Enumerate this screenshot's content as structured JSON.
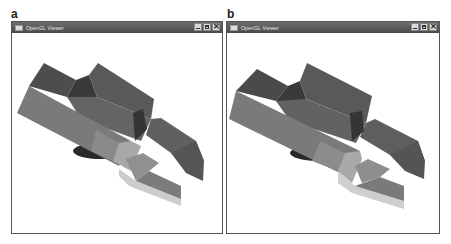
{
  "figure": {
    "panels": [
      {
        "label": "a",
        "window": {
          "title": "OpenGL Viewer",
          "icons": [
            "app-icon",
            "minimize-icon",
            "maximize-icon",
            "close-icon"
          ],
          "close_glyph": "✕"
        },
        "scene": "3D solid model rendered in grey shading (block with raised ridge, notch and fin)"
      },
      {
        "label": "b",
        "window": {
          "title": "OpenGL Viewer",
          "icons": [
            "app-icon",
            "minimize-icon",
            "maximize-icon",
            "close-icon"
          ],
          "close_glyph": "✕"
        },
        "scene": "3D solid model rendered in grey shading (block with raised ridge, notch and fin)"
      }
    ],
    "colors": {
      "titlebar": "#555555",
      "window_border": "#555555",
      "viewport_bg": "#ffffff",
      "face_dark": "#4a4a4a",
      "face_mid": "#6e6e6e",
      "face_front": "#7d7d7d",
      "face_light": "#b8b8b8",
      "face_lighter": "#d2d2d2",
      "shadow": "#2a2a2a"
    }
  }
}
